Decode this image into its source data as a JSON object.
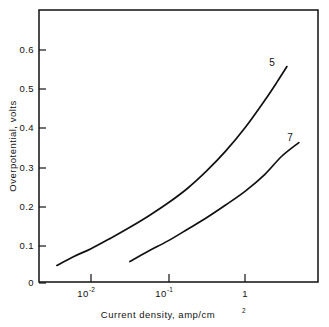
{
  "chart_data": {
    "type": "line",
    "title": "",
    "xlabel": "Current density, amp/cm",
    "xlabel_sup": "2",
    "ylabel": "Overpotential, volts",
    "xscale": "log",
    "yscale": "linear",
    "xlim": [
      0.0036,
      5.6
    ],
    "ylim": [
      0.0,
      0.695
    ],
    "grid": false,
    "legend": "inline-end-labels",
    "xticks": [
      0.01,
      0.1,
      1
    ],
    "xtick_labels": [
      "10⁻²",
      "10⁻¹",
      "1"
    ],
    "xtick_mantissas": [
      "10",
      "10",
      "1"
    ],
    "xtick_exponents": [
      "-2",
      "-1",
      ""
    ],
    "yticks": [
      0,
      0.1,
      0.2,
      0.3,
      0.4,
      0.5,
      0.6
    ],
    "ytick_labels": [
      "0",
      "0.1",
      "0.2",
      "0.3",
      "0.4",
      "0.5",
      "0.6"
    ],
    "series": [
      {
        "name": "5",
        "label": "5",
        "color": "#111111",
        "x": [
          0.0036,
          0.006,
          0.01,
          0.018,
          0.032,
          0.056,
          0.1,
          0.18,
          0.32,
          0.56,
          1.0,
          1.8,
          2.6,
          3.5
        ],
        "y": [
          0.045,
          0.068,
          0.088,
          0.115,
          0.143,
          0.172,
          0.205,
          0.243,
          0.288,
          0.338,
          0.398,
          0.468,
          0.515,
          0.555
        ]
      },
      {
        "name": "7",
        "label": "7",
        "color": "#111111",
        "x": [
          0.032,
          0.056,
          0.1,
          0.18,
          0.32,
          0.56,
          1.0,
          1.8,
          3.0,
          5.0
        ],
        "y": [
          0.055,
          0.082,
          0.108,
          0.138,
          0.168,
          0.2,
          0.235,
          0.278,
          0.325,
          0.36
        ]
      }
    ]
  },
  "axes": {
    "x_title": "Current density, amp/cm",
    "x_title_sup": "2",
    "y_title": "Overpotential, volts"
  },
  "curve_labels": {
    "upper": "5",
    "lower": "7"
  }
}
